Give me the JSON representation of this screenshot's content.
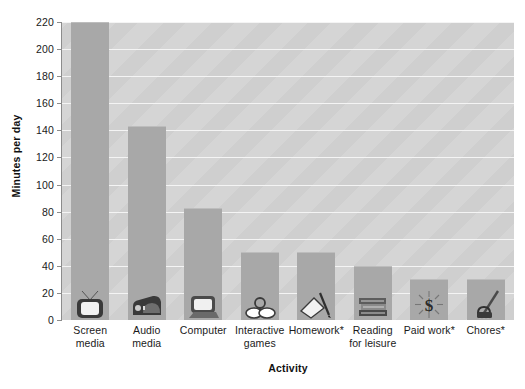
{
  "chart_data": {
    "type": "bar",
    "title": "",
    "xlabel": "Activity",
    "ylabel": "Minutes per day",
    "ylim": [
      0,
      220
    ],
    "ytick_step": 20,
    "yticks": [
      0,
      20,
      40,
      60,
      80,
      100,
      120,
      140,
      160,
      180,
      200,
      220
    ],
    "grid": true,
    "legend": "none",
    "categories": [
      "Screen media",
      "Audio media",
      "Computer",
      "Interactive games",
      "Homework*",
      "Reading for leisure",
      "Paid work*",
      "Chores*"
    ],
    "values": [
      220,
      143,
      83,
      50,
      50,
      40,
      30,
      30
    ],
    "bars": [
      {
        "label_lines": [
          "Screen",
          "media"
        ],
        "value": 220,
        "icon": "television-icon"
      },
      {
        "label_lines": [
          "Audio",
          "media"
        ],
        "value": 143,
        "icon": "radio-icon"
      },
      {
        "label_lines": [
          "Computer"
        ],
        "value": 83,
        "icon": "computer-monitor-icon"
      },
      {
        "label_lines": [
          "Interactive",
          "games"
        ],
        "value": 50,
        "icon": "game-controller-icon"
      },
      {
        "label_lines": [
          "Homework*"
        ],
        "value": 50,
        "icon": "book-and-pencil-icon"
      },
      {
        "label_lines": [
          "Reading",
          "for leisure"
        ],
        "value": 40,
        "icon": "stack-of-books-icon"
      },
      {
        "label_lines": [
          "Paid work*"
        ],
        "value": 30,
        "icon": "dollar-sign-icon"
      },
      {
        "label_lines": [
          "Chores*"
        ],
        "value": 30,
        "icon": "broom-and-bucket-icon"
      }
    ],
    "colors": {
      "bar_fill": "#a8a8a8",
      "plot_background": "#cfcfcf",
      "gridline": "#f4f4f4",
      "axis_line": "#8c8c8c",
      "text": "#1a1a1a",
      "figure_background": "#ffffff"
    }
  }
}
